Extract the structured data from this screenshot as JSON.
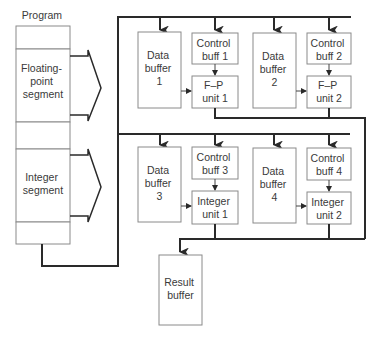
{
  "diagram": {
    "program": {
      "title": "Program",
      "segments": [
        {
          "id": "blank-top",
          "label": ""
        },
        {
          "id": "floating-point",
          "label": [
            "Floating-",
            "point",
            "segment"
          ]
        },
        {
          "id": "blank-mid",
          "label": ""
        },
        {
          "id": "integer",
          "label": [
            "Integer",
            "segment"
          ]
        },
        {
          "id": "blank-bottom",
          "label": ""
        }
      ]
    },
    "units": [
      {
        "data_buffer": [
          "Data",
          "buffer",
          "1"
        ],
        "control": [
          "Control",
          "buff 1"
        ],
        "exec": [
          "F–P",
          "unit 1"
        ]
      },
      {
        "data_buffer": [
          "Data",
          "buffer",
          "2"
        ],
        "control": [
          "Control",
          "buff 2"
        ],
        "exec": [
          "F–P",
          "unit 2"
        ]
      },
      {
        "data_buffer": [
          "Data",
          "buffer",
          "3"
        ],
        "control": [
          "Control",
          "buff 3"
        ],
        "exec": [
          "Integer",
          "unit 1"
        ]
      },
      {
        "data_buffer": [
          "Data",
          "buffer",
          "4"
        ],
        "control": [
          "Control",
          "buff 4"
        ],
        "exec": [
          "Integer",
          "unit 2"
        ]
      }
    ],
    "result_buffer": [
      "Result",
      "buffer"
    ]
  }
}
